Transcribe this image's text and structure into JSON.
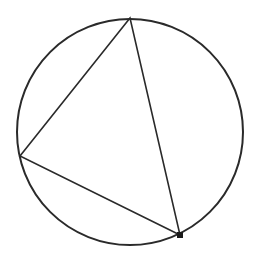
{
  "diagram": {
    "type": "inscribed-triangle",
    "width": 255,
    "height": 257,
    "colors": {
      "stroke": "#2a2a2a",
      "background": "#ffffff",
      "point": "#1a1a1a"
    },
    "circle": {
      "cx": 130,
      "cy": 132,
      "r": 113,
      "stroke_width": 2
    },
    "triangle": {
      "stroke_width": 1.6,
      "vertices": [
        {
          "name": "top",
          "x": 130,
          "y": 18
        },
        {
          "name": "left",
          "x": 20,
          "y": 156
        },
        {
          "name": "bottom-right",
          "x": 180,
          "y": 235
        }
      ]
    },
    "marked_point": {
      "x": 180,
      "y": 235,
      "size": 6
    }
  }
}
